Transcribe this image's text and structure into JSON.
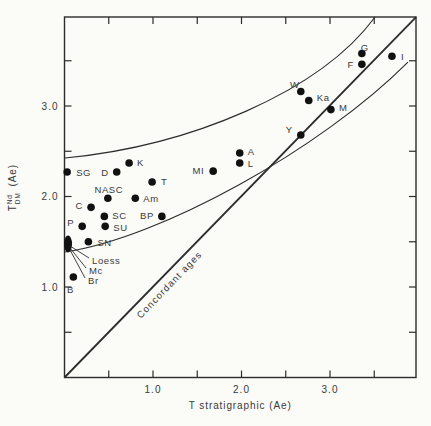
{
  "figure": {
    "background": "#fbfbf8",
    "ink": "#2c2c2c",
    "dot_color": "#111111"
  },
  "chart_data": {
    "type": "scatter",
    "title": "",
    "xlabel": "T stratigraphic (Ae)",
    "ylabel": "T DM Nd (Ae)",
    "ylabel_parts": {
      "base": "T",
      "sup": "Nd",
      "sub": "DM",
      "unit": "(Ae)"
    },
    "xlim": [
      0,
      3.97
    ],
    "ylim": [
      0,
      3.98
    ],
    "grid": false,
    "tick_values": [
      0.5,
      1.0,
      1.5,
      2.0,
      2.5,
      3.0,
      3.5
    ],
    "x_tick_labels": [
      {
        "value": 1.0,
        "text": "1.0"
      },
      {
        "value": 2.0,
        "text": "2.0"
      },
      {
        "value": 3.0,
        "text": "3.0"
      }
    ],
    "y_tick_labels": [
      {
        "value": 1.0,
        "text": "1.0"
      },
      {
        "value": 2.0,
        "text": "2.0"
      },
      {
        "value": 3.0,
        "text": "3.0"
      }
    ],
    "points": [
      {
        "label": "SG",
        "x": 0.03,
        "y": 2.27,
        "dx": 9,
        "dy": 1,
        "anchor": "start"
      },
      {
        "label": "D",
        "x": 0.59,
        "y": 2.27,
        "dx": -8,
        "dy": 1,
        "anchor": "end"
      },
      {
        "label": "K",
        "x": 0.73,
        "y": 2.37,
        "dx": 8,
        "dy": 0,
        "anchor": "start"
      },
      {
        "label": "T",
        "x": 0.99,
        "y": 2.16,
        "dx": 9,
        "dy": 0,
        "anchor": "start"
      },
      {
        "label": "NASC",
        "x": 0.49,
        "y": 1.98,
        "dx": 1,
        "dy": -8,
        "anchor": "middle"
      },
      {
        "label": "Am",
        "x": 0.8,
        "y": 1.98,
        "dx": 8,
        "dy": 1,
        "anchor": "start"
      },
      {
        "label": "C",
        "x": 0.3,
        "y": 1.88,
        "dx": -8,
        "dy": -1,
        "anchor": "end"
      },
      {
        "label": "SC",
        "x": 0.45,
        "y": 1.78,
        "dx": 8,
        "dy": 0,
        "anchor": "start"
      },
      {
        "label": "P",
        "x": 0.2,
        "y": 1.67,
        "dx": -8,
        "dy": -3,
        "anchor": "end"
      },
      {
        "label": "SU",
        "x": 0.46,
        "y": 1.67,
        "dx": 8,
        "dy": 2,
        "anchor": "start"
      },
      {
        "label": "BP",
        "x": 1.1,
        "y": 1.78,
        "dx": -8,
        "dy": 0,
        "anchor": "end"
      },
      {
        "label": "SN",
        "x": 0.27,
        "y": 1.5,
        "dx": 9,
        "dy": 1,
        "anchor": "start"
      },
      {
        "label": "B",
        "x": 0.1,
        "y": 1.11,
        "dx": -3,
        "dy": 13,
        "anchor": "middle"
      },
      {
        "label": "MI",
        "x": 1.68,
        "y": 2.28,
        "dx": -9,
        "dy": 0,
        "anchor": "end"
      },
      {
        "label": "A",
        "x": 1.98,
        "y": 2.48,
        "dx": 8,
        "dy": -1,
        "anchor": "start"
      },
      {
        "label": "L",
        "x": 1.98,
        "y": 2.37,
        "dx": 8,
        "dy": 1,
        "anchor": "start"
      },
      {
        "label": "Y",
        "x": 2.67,
        "y": 2.68,
        "dx": -8,
        "dy": -5,
        "anchor": "end"
      },
      {
        "label": "W",
        "x": 2.67,
        "y": 3.16,
        "dx": -6,
        "dy": -7,
        "anchor": "middle"
      },
      {
        "label": "Ka",
        "x": 2.76,
        "y": 3.06,
        "dx": 8,
        "dy": -3,
        "anchor": "start"
      },
      {
        "label": "M",
        "x": 3.01,
        "y": 2.96,
        "dx": 8,
        "dy": -2,
        "anchor": "start"
      },
      {
        "label": "G",
        "x": 3.36,
        "y": 3.58,
        "dx": 3,
        "dy": -6,
        "anchor": "middle"
      },
      {
        "label": "F",
        "x": 3.36,
        "y": 3.46,
        "dx": -8,
        "dy": 1,
        "anchor": "end"
      },
      {
        "label": "I",
        "x": 3.7,
        "y": 3.55,
        "dx": 9,
        "dy": 1,
        "anchor": "start"
      }
    ],
    "overlap_cluster": {
      "x": 0.04,
      "y": 1.475,
      "rx": 4,
      "ry": 8.5,
      "leaders": [
        {
          "label": "Loess",
          "tx": 24,
          "ty": 17
        },
        {
          "label": "Mc",
          "tx": 21,
          "ty": 27
        },
        {
          "label": "Br",
          "tx": 20,
          "ty": 37
        }
      ]
    },
    "diagonal": {
      "label": "Concordant ages",
      "from": [
        0,
        0
      ],
      "to": [
        3.972,
        3.983
      ],
      "label_pos": {
        "x": 1.21,
        "y": 1.0,
        "angle": -46
      }
    },
    "band_curves": {
      "upper": [
        [
          0.006,
          2.425
        ],
        [
          1.418,
          2.558
        ],
        [
          2.887,
          3.155
        ],
        [
          3.509,
          3.983
        ]
      ],
      "lower": [
        [
          0.006,
          1.387
        ],
        [
          1.079,
          1.541
        ],
        [
          2.887,
          2.514
        ],
        [
          3.881,
          3.486
        ]
      ]
    }
  }
}
